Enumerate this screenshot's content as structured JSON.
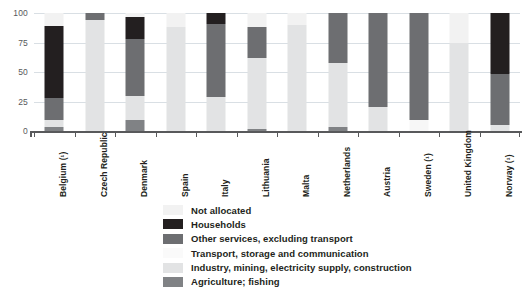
{
  "chart_data": {
    "type": "bar",
    "subtype": "stacked-bar-100",
    "title": "",
    "xlabel": "",
    "ylabel": "",
    "ylim": [
      0,
      100
    ],
    "yticks": [
      "0",
      "25",
      "50",
      "75",
      "100"
    ],
    "grid": true,
    "legend_position": "bottom-center",
    "categories": [
      "Belgium (¹)",
      "Czech Republic",
      "Denmark",
      "Spain",
      "Italy",
      "Lithuania",
      "Malta",
      "Netherlands",
      "Austria",
      "Sweden (¹)",
      "United Kingdom",
      "Norway (¹)"
    ],
    "series": [
      {
        "name": "Agriculture; fishing",
        "color": "#808285",
        "values": [
          3,
          0,
          9,
          0,
          0,
          2,
          0,
          3,
          0,
          0,
          0,
          0
        ]
      },
      {
        "name": "Industry, mining, electricity supply, construction",
        "color": "#e2e3e4",
        "values": [
          6,
          94,
          21,
          88,
          29,
          60,
          90,
          55,
          20,
          0,
          75,
          5
        ]
      },
      {
        "name": "Transport, storage and communication",
        "color": "#f7f7f7",
        "values": [
          0,
          0,
          0,
          0,
          0,
          0,
          0,
          0,
          0,
          9,
          0,
          0
        ]
      },
      {
        "name": "Other services, excluding transport",
        "color": "#6d6e71",
        "values": [
          19,
          6,
          48,
          0,
          62,
          26,
          0,
          42,
          80,
          91,
          0,
          43
        ]
      },
      {
        "name": "Households",
        "color": "#231f20",
        "values": [
          61,
          0,
          19,
          0,
          9,
          0,
          0,
          0,
          0,
          0,
          0,
          52
        ]
      },
      {
        "name": "Not allocated",
        "color": "#f2f2f2",
        "values": [
          11,
          0,
          3,
          12,
          0,
          12,
          10,
          0,
          0,
          0,
          25,
          0
        ]
      }
    ],
    "legend": [
      {
        "label": "Not allocated",
        "color": "#f2f2f2"
      },
      {
        "label": "Households",
        "color": "#231f20"
      },
      {
        "label": "Other services, excluding transport",
        "color": "#6d6e71"
      },
      {
        "label": "Transport, storage and communication",
        "color": "#fafafa"
      },
      {
        "label": "Industry, mining, electricity supply, construction",
        "color": "#e2e3e4"
      },
      {
        "label": "Agriculture; fishing",
        "color": "#808285"
      }
    ],
    "stack_order_bottom_to_top": [
      "Agriculture; fishing",
      "Industry, mining, electricity supply, construction",
      "Transport, storage and communication",
      "Other services, excluding transport",
      "Households",
      "Not allocated"
    ],
    "colors": {
      "grid": "#d9dfe4",
      "axis": "#58595b",
      "tick_text": "#58595b",
      "label_text": "#231f20",
      "background": "#ffffff"
    }
  }
}
